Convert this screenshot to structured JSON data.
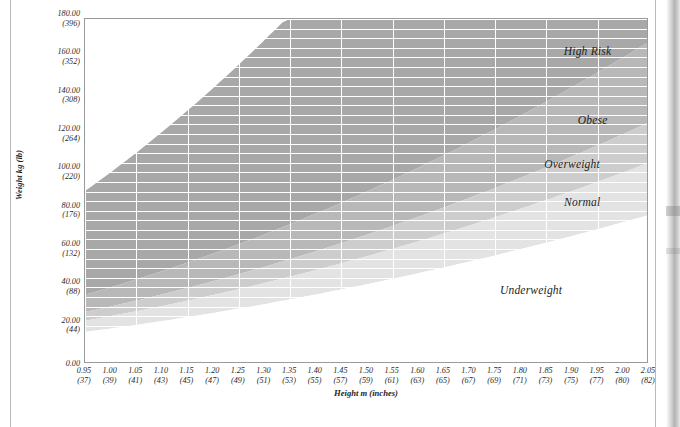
{
  "chart_data": {
    "type": "area",
    "title": "",
    "xlabel": "Height m (inches)",
    "ylabel": "Weight kg (lb)",
    "xlim": [
      0.95,
      2.05
    ],
    "ylim": [
      0,
      180
    ],
    "grid": true,
    "legend_position": "in-plot-right",
    "x_tick_step": 0.05,
    "y_tick_step": 20,
    "x_ticks": [
      {
        "m": "0.95",
        "inches": "(37)"
      },
      {
        "m": "1.00",
        "inches": "(39)"
      },
      {
        "m": "1.05",
        "inches": "(41)"
      },
      {
        "m": "1.10",
        "inches": "(43)"
      },
      {
        "m": "1.15",
        "inches": "(45)"
      },
      {
        "m": "1.20",
        "inches": "(47)"
      },
      {
        "m": "1.25",
        "inches": "(49)"
      },
      {
        "m": "1.30",
        "inches": "(51)"
      },
      {
        "m": "1.35",
        "inches": "(53)"
      },
      {
        "m": "1.40",
        "inches": "(55)"
      },
      {
        "m": "1.45",
        "inches": "(57)"
      },
      {
        "m": "1.50",
        "inches": "(59)"
      },
      {
        "m": "1.55",
        "inches": "(61)"
      },
      {
        "m": "1.60",
        "inches": "(63)"
      },
      {
        "m": "1.65",
        "inches": "(65)"
      },
      {
        "m": "1.70",
        "inches": "(67)"
      },
      {
        "m": "1.75",
        "inches": "(69)"
      },
      {
        "m": "1.80",
        "inches": "(71)"
      },
      {
        "m": "1.85",
        "inches": "(73)"
      },
      {
        "m": "1.90",
        "inches": "(75)"
      },
      {
        "m": "1.95",
        "inches": "(77)"
      },
      {
        "m": "2.00",
        "inches": "(80)"
      },
      {
        "m": "2.05",
        "inches": "(82)"
      }
    ],
    "y_ticks": [
      {
        "kg": "180.00",
        "lb": "(396)"
      },
      {
        "kg": "160.00",
        "lb": "(352)"
      },
      {
        "kg": "140.00",
        "lb": "(308)"
      },
      {
        "kg": "120.00",
        "lb": "(264)"
      },
      {
        "kg": "100.00",
        "lb": "(220)"
      },
      {
        "kg": "80.00",
        "lb": "(176)"
      },
      {
        "kg": "60.00",
        "lb": "(132)"
      },
      {
        "kg": "40.00",
        "lb": "(88)"
      },
      {
        "kg": "20.00",
        "lb": "(44)"
      },
      {
        "kg": "0.00",
        "lb": ""
      }
    ],
    "bands": [
      {
        "name": "Underweight",
        "label": "Underweight",
        "bmi_min": 0,
        "bmi_max": 18.5,
        "color": "#ffffff",
        "label_x": 1.82,
        "label_y": 38
      },
      {
        "name": "Normal",
        "label": "Normal",
        "bmi_min": 18.5,
        "bmi_max": 25,
        "color": "#e3e3e3",
        "label_x": 1.92,
        "label_y": 84
      },
      {
        "name": "Overweight",
        "label": "Overweight",
        "bmi_min": 25,
        "bmi_max": 30,
        "color": "#cdcdcd",
        "label_x": 1.9,
        "label_y": 104
      },
      {
        "name": "Obese",
        "label": "Obese",
        "bmi_min": 30,
        "bmi_max": 40,
        "color": "#b8b8b8",
        "label_x": 1.94,
        "label_y": 127
      },
      {
        "name": "High Risk",
        "label": "High Risk",
        "bmi_min": 40,
        "bmi_max": 100,
        "color": "#a8a8a8",
        "label_x": 1.93,
        "label_y": 163
      }
    ],
    "gridline_color": "#ffffff",
    "axis_color": "#9a9a9a",
    "minor_y_step": 5,
    "minor_x_step": 0.1
  }
}
